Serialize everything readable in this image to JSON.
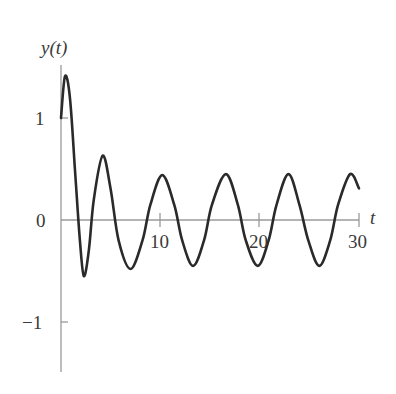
{
  "chart_data": {
    "type": "line",
    "title": "",
    "xlabel": "t",
    "ylabel": "y(t)",
    "xlim": [
      0,
      30
    ],
    "ylim": [
      -1.5,
      1.5
    ],
    "x_ticks": [
      10,
      20,
      30
    ],
    "x_tick_labels": [
      "10",
      "20",
      "30"
    ],
    "y_ticks": [
      -1,
      0,
      1
    ],
    "y_tick_labels": [
      "−1",
      "0",
      "1"
    ],
    "grid": false,
    "legend": null,
    "series": [
      {
        "name": "y(t)",
        "color": "#2a2a2a",
        "points": [
          [
            0.0,
            1.0
          ],
          [
            0.4,
            1.41
          ],
          [
            0.9,
            1.2
          ],
          [
            1.4,
            0.5
          ],
          [
            1.9,
            -0.2
          ],
          [
            2.3,
            -0.55
          ],
          [
            2.8,
            -0.3
          ],
          [
            3.3,
            0.2
          ],
          [
            4.2,
            0.63
          ],
          [
            5.0,
            0.3
          ],
          [
            5.8,
            -0.2
          ],
          [
            7.0,
            -0.48
          ],
          [
            8.2,
            -0.2
          ],
          [
            9.0,
            0.15
          ],
          [
            10.2,
            0.44
          ],
          [
            11.4,
            0.15
          ],
          [
            12.2,
            -0.2
          ],
          [
            13.3,
            -0.45
          ],
          [
            14.4,
            -0.2
          ],
          [
            15.2,
            0.15
          ],
          [
            16.6,
            0.45
          ],
          [
            17.8,
            0.15
          ],
          [
            18.6,
            -0.2
          ],
          [
            19.8,
            -0.45
          ],
          [
            20.9,
            -0.2
          ],
          [
            21.7,
            0.15
          ],
          [
            22.9,
            0.45
          ],
          [
            24.0,
            0.15
          ],
          [
            24.9,
            -0.2
          ],
          [
            26.0,
            -0.45
          ],
          [
            27.1,
            -0.2
          ],
          [
            27.9,
            0.15
          ],
          [
            29.1,
            0.45
          ],
          [
            30.0,
            0.31
          ]
        ]
      }
    ]
  },
  "labels": {
    "y_axis": "y(t)",
    "x_axis": "t",
    "ytick_1": "1",
    "ytick_0": "0",
    "ytick_m1": "−1",
    "xtick_10": "10",
    "xtick_20": "20",
    "xtick_30": "30"
  }
}
